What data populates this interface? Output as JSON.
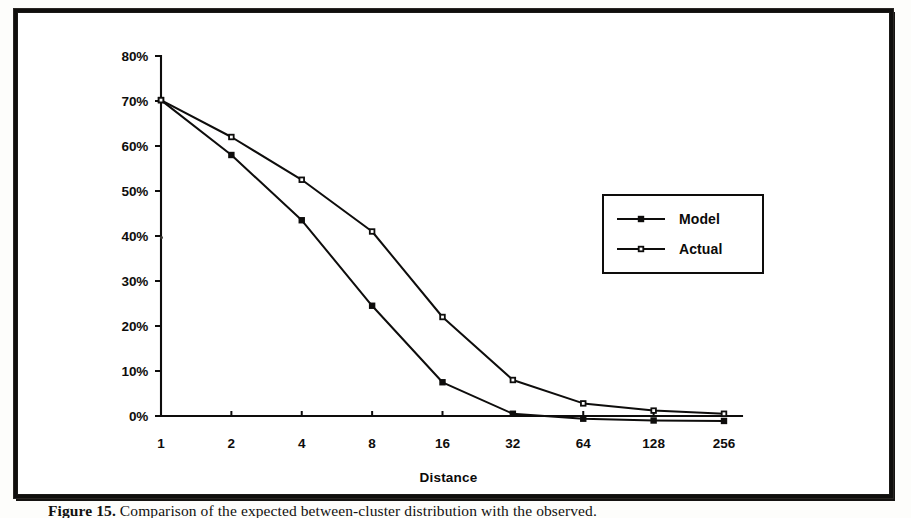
{
  "figure": {
    "caption_label": "Figure 15.",
    "caption_rest": " Comparison of the expected between-cluster distribution with the observed."
  },
  "chart_data": {
    "type": "line",
    "title": "",
    "xlabel": "Distance",
    "ylabel": "",
    "categories": [
      "1",
      "2",
      "4",
      "8",
      "16",
      "32",
      "64",
      "128",
      "256"
    ],
    "x_tick_labels": [
      "1",
      "2",
      "4",
      "8",
      "16",
      "32",
      "64",
      "128",
      "256"
    ],
    "y_tick_labels": [
      "0%",
      "10%",
      "20%",
      "30%",
      "40%",
      "50%",
      "60%",
      "70%",
      "80%"
    ],
    "y_tick_values": [
      0,
      10,
      20,
      30,
      40,
      50,
      60,
      70,
      80
    ],
    "ylim": [
      -2,
      80
    ],
    "xlim_index": [
      0,
      8
    ],
    "grid": false,
    "x_scale": "log2-categorical",
    "legend_position": "upper-right",
    "series": [
      {
        "name": "Model",
        "marker": "filled-square",
        "values": [
          70.2,
          58.0,
          43.5,
          24.5,
          7.5,
          0.5,
          -0.6,
          -1.0,
          -1.1
        ]
      },
      {
        "name": "Actual",
        "marker": "open-square",
        "values": [
          70.2,
          62.0,
          52.5,
          41.0,
          22.0,
          8.0,
          2.8,
          1.2,
          0.5
        ]
      }
    ]
  },
  "legend": {
    "entries": [
      {
        "label": "Model"
      },
      {
        "label": "Actual"
      }
    ]
  },
  "colors": {
    "ink": "#0e0d0c",
    "paper": "#ffffff",
    "frame": "#100f0d"
  }
}
